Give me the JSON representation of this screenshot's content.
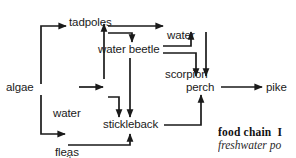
{
  "diagram": {
    "type": "food-chain-flow-diagram",
    "nodes": [
      {
        "id": "algae",
        "label": "algae"
      },
      {
        "id": "tadpoles",
        "label": "tadpoles"
      },
      {
        "id": "water-fleas",
        "label_line1": "water",
        "label_line2": "fleas"
      },
      {
        "id": "mosquito-larvae",
        "label_line1": "mosquito",
        "label_line2": "larvae"
      },
      {
        "id": "water-beetle",
        "label": "water beetle"
      },
      {
        "id": "water-scorpion",
        "label_line1": "water",
        "label_line2": "scorpion"
      },
      {
        "id": "stickleback",
        "label": "stickleback"
      },
      {
        "id": "perch",
        "label": "perch"
      },
      {
        "id": "pike",
        "label": "pike"
      }
    ],
    "edges": [
      {
        "from": "algae",
        "to": "tadpoles"
      },
      {
        "from": "algae",
        "to": "water-fleas"
      },
      {
        "from": "algae",
        "to": "mosquito-larvae"
      },
      {
        "from": "water-fleas",
        "to": "tadpoles"
      },
      {
        "from": "water-fleas",
        "to": "stickleback"
      },
      {
        "from": "tadpoles",
        "to": "water-scorpion"
      },
      {
        "from": "tadpoles",
        "to": "water-beetle"
      },
      {
        "from": "water-beetle",
        "to": "stickleback"
      },
      {
        "from": "water-beetle",
        "to": "water-scorpion"
      },
      {
        "from": "water-beetle",
        "to": "perch"
      },
      {
        "from": "water-scorpion",
        "to": "perch"
      },
      {
        "from": "mosquito-larvae",
        "to": "stickleback"
      },
      {
        "from": "stickleback",
        "to": "perch"
      },
      {
        "from": "perch",
        "to": "pike"
      }
    ],
    "stroke_color": "#1a1a1a"
  },
  "caption": {
    "term": "food chain",
    "lead": "I",
    "line2": "freshwater po"
  }
}
